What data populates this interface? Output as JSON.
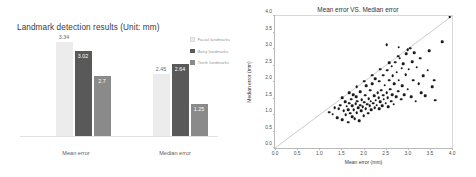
{
  "chart_data": [
    {
      "type": "bar",
      "title": "Landmark detection results (Unit: mm)",
      "xlabel": "",
      "ylabel": "",
      "categories": [
        "Mean error",
        "Median error"
      ],
      "ylim": [
        0,
        3.6
      ],
      "grid": false,
      "legend_position": "right",
      "series": [
        {
          "name": "Facial landmarks",
          "color": "#ececec",
          "values": [
            3.34,
            2.45
          ],
          "labels": [
            "3.34",
            "2.45"
          ]
        },
        {
          "name": "Bony landmarks",
          "color": "#595959",
          "values": [
            3.02,
            2.64
          ],
          "labels": [
            "3.02",
            "2.64"
          ]
        },
        {
          "name": "Teeth landmarks",
          "color": "#8a8a8a",
          "values": [
            2.7,
            1.25
          ],
          "labels": [
            "2.7",
            "1.25"
          ]
        }
      ]
    },
    {
      "type": "scatter",
      "title": "Mean error VS. Median error",
      "xlabel": "Mean error (mm)",
      "ylabel": "Median error (mm)",
      "xlim": [
        0.0,
        4.0
      ],
      "ylim": [
        0.0,
        4.0
      ],
      "xticks": [
        "0.0",
        "0.5",
        "1.0",
        "1.5",
        "2.0",
        "2.5",
        "3.0",
        "3.5",
        "4.0"
      ],
      "yticks": [
        "0.0",
        "0.5",
        "1.0",
        "1.5",
        "2.0",
        "2.5",
        "3.0",
        "3.5",
        "4.0"
      ],
      "grid": false,
      "marker_color": "#1b1b1b",
      "reference_line": {
        "type": "identity",
        "from": [
          0.0,
          0.0
        ],
        "to": [
          4.0,
          4.0
        ],
        "color": "#8c8c8c"
      },
      "points": [
        [
          1.22,
          1.08
        ],
        [
          1.3,
          1.02
        ],
        [
          1.35,
          1.22
        ],
        [
          1.4,
          0.92
        ],
        [
          1.44,
          1.18
        ],
        [
          1.48,
          1.3
        ],
        [
          1.52,
          0.86
        ],
        [
          1.55,
          1.12
        ],
        [
          1.58,
          1.4
        ],
        [
          1.6,
          1.0
        ],
        [
          1.62,
          1.26
        ],
        [
          1.65,
          0.78
        ],
        [
          1.66,
          1.16
        ],
        [
          1.68,
          1.36
        ],
        [
          1.7,
          1.05
        ],
        [
          1.72,
          1.48
        ],
        [
          1.74,
          0.95
        ],
        [
          1.75,
          1.28
        ],
        [
          1.77,
          1.62
        ],
        [
          1.78,
          1.15
        ],
        [
          1.8,
          0.88
        ],
        [
          1.82,
          1.34
        ],
        [
          1.84,
          1.55
        ],
        [
          1.85,
          1.07
        ],
        [
          1.86,
          1.42
        ],
        [
          1.88,
          1.22
        ],
        [
          1.9,
          0.82
        ],
        [
          1.92,
          1.3
        ],
        [
          1.93,
          1.7
        ],
        [
          1.95,
          1.12
        ],
        [
          1.96,
          1.46
        ],
        [
          1.98,
          1.25
        ],
        [
          2.0,
          0.97
        ],
        [
          2.02,
          1.38
        ],
        [
          2.04,
          1.6
        ],
        [
          2.05,
          1.18
        ],
        [
          2.06,
          1.88
        ],
        [
          2.08,
          1.33
        ],
        [
          2.1,
          1.05
        ],
        [
          2.12,
          1.5
        ],
        [
          2.14,
          1.28
        ],
        [
          2.15,
          1.75
        ],
        [
          2.16,
          1.42
        ],
        [
          2.18,
          1.15
        ],
        [
          2.2,
          1.95
        ],
        [
          2.22,
          1.35
        ],
        [
          2.24,
          1.58
        ],
        [
          2.25,
          1.22
        ],
        [
          2.26,
          2.1
        ],
        [
          2.28,
          1.45
        ],
        [
          2.3,
          1.3
        ],
        [
          2.32,
          1.68
        ],
        [
          2.34,
          1.52
        ],
        [
          2.35,
          1.18
        ],
        [
          2.36,
          2.02
        ],
        [
          2.38,
          1.4
        ],
        [
          2.4,
          1.75
        ],
        [
          2.42,
          1.28
        ],
        [
          2.44,
          1.6
        ],
        [
          2.45,
          2.2
        ],
        [
          2.46,
          1.48
        ],
        [
          2.48,
          1.9
        ],
        [
          2.5,
          1.35
        ],
        [
          2.52,
          1.68
        ],
        [
          2.54,
          2.35
        ],
        [
          2.55,
          1.52
        ],
        [
          2.56,
          1.25
        ],
        [
          2.58,
          2.05
        ],
        [
          2.6,
          1.78
        ],
        [
          2.62,
          1.42
        ],
        [
          2.64,
          2.48
        ],
        [
          2.65,
          1.62
        ],
        [
          2.66,
          2.18
        ],
        [
          2.68,
          1.32
        ],
        [
          2.7,
          1.95
        ],
        [
          2.72,
          2.6
        ],
        [
          2.74,
          1.55
        ],
        [
          2.75,
          2.3
        ],
        [
          2.78,
          1.72
        ],
        [
          2.8,
          2.05
        ],
        [
          2.82,
          2.72
        ],
        [
          2.85,
          1.48
        ],
        [
          2.86,
          2.42
        ],
        [
          2.88,
          1.88
        ],
        [
          2.9,
          2.55
        ],
        [
          2.92,
          1.62
        ],
        [
          2.95,
          2.22
        ],
        [
          2.96,
          2.85
        ],
        [
          3.0,
          1.78
        ],
        [
          3.02,
          2.38
        ],
        [
          3.05,
          3.02
        ],
        [
          3.08,
          1.55
        ],
        [
          3.1,
          2.62
        ],
        [
          3.12,
          2.05
        ],
        [
          3.15,
          2.88
        ],
        [
          3.18,
          1.42
        ],
        [
          3.2,
          2.45
        ],
        [
          3.25,
          1.95
        ],
        [
          3.28,
          2.72
        ],
        [
          3.3,
          1.68
        ],
        [
          3.35,
          2.18
        ],
        [
          3.4,
          1.58
        ],
        [
          3.45,
          2.35
        ],
        [
          3.55,
          1.85
        ],
        [
          3.6,
          2.05
        ],
        [
          3.62,
          1.45
        ],
        [
          3.78,
          3.22
        ],
        [
          3.48,
          2.95
        ],
        [
          2.52,
          3.12
        ],
        [
          2.8,
          3.05
        ],
        [
          1.52,
          1.52
        ],
        [
          1.68,
          1.68
        ],
        [
          1.85,
          1.85
        ],
        [
          2.02,
          2.02
        ],
        [
          2.2,
          2.2
        ],
        [
          2.38,
          2.38
        ],
        [
          2.58,
          2.58
        ],
        [
          2.78,
          2.78
        ],
        [
          3.0,
          2.98
        ],
        [
          3.95,
          3.98
        ]
      ]
    }
  ],
  "bar_chart": {
    "title": "Landmark detection results (Unit: mm)",
    "categories": [
      "Mean error",
      "Median error"
    ],
    "legend": [
      {
        "label": "Facial landmarks",
        "color": "#ececec"
      },
      {
        "label": "Bony landmarks",
        "color": "#595959"
      },
      {
        "label": "Teeth landmarks",
        "color": "#8a8a8a"
      }
    ],
    "bars": {
      "g1b1": "3.34",
      "g1b2": "3.02",
      "g1b3": "2.7",
      "g2b1": "2.45",
      "g2b2": "2.64",
      "g2b3": "1.25"
    }
  },
  "scatter": {
    "title": "Mean error VS. Median error",
    "xlabel": "Mean error (mm)",
    "ylabel": "Median error (mm)"
  }
}
